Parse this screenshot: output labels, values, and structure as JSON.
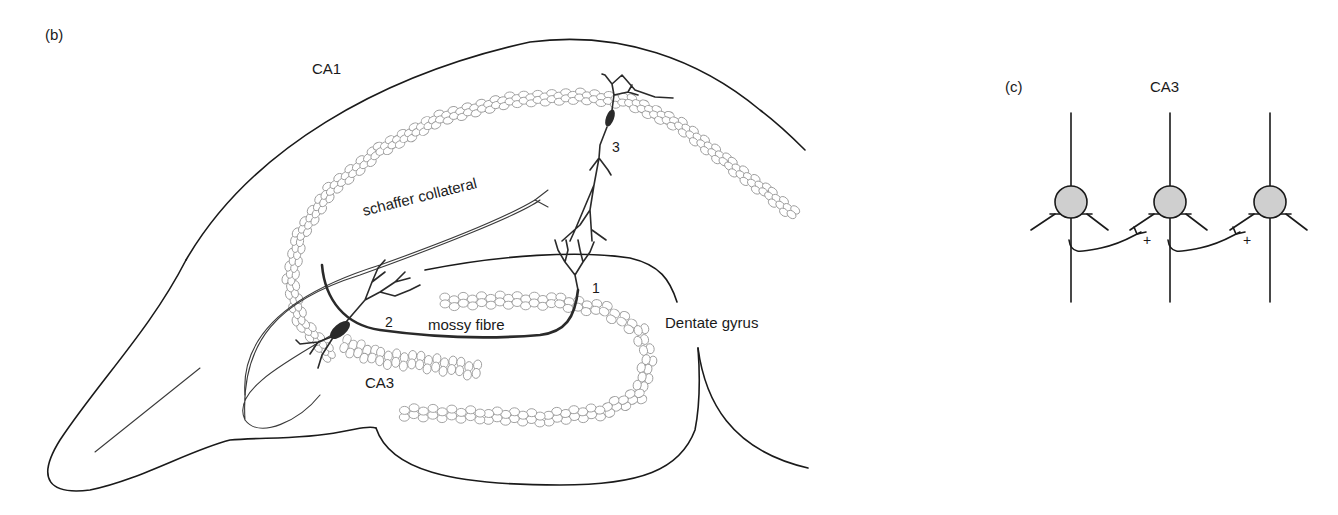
{
  "panel_b": {
    "panel_label": "(b)",
    "labels": {
      "ca1": "CA1",
      "ca3": "CA3",
      "schaffer": "schaffer collateral",
      "mossy": "mossy fibre",
      "dentate": "Dentate gyrus",
      "neuron1": "1",
      "neuron2": "2",
      "neuron3": "3"
    }
  },
  "panel_c": {
    "panel_label": "(c)",
    "title": "CA3",
    "synapse_signs": [
      "+",
      "+"
    ],
    "neuron_count": 3
  },
  "colors": {
    "line": "#1a1a1a",
    "cell_layer": "#9a9a9a",
    "soma_fill": "#cfcfcf",
    "background": "#ffffff"
  }
}
